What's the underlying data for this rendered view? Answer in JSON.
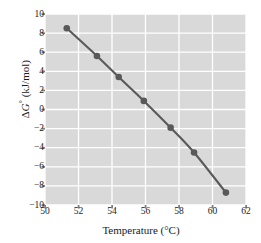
{
  "chart_data": {
    "type": "line",
    "title": "",
    "xlabel": "Temperature (°C)",
    "ylabel": "ΔG° (kJ/mol)",
    "ylabel_parts": {
      "delta": "Δ",
      "symbol": "G",
      "degree": "°",
      "units": " (kJ/mol)"
    },
    "xlim": [
      50,
      62
    ],
    "ylim": [
      -10,
      10
    ],
    "xticks": [
      50,
      52,
      54,
      56,
      58,
      60,
      62
    ],
    "xtick_labels": [
      "50",
      "52",
      "54",
      "56",
      "58",
      "60",
      "62"
    ],
    "yticks": [
      10,
      8,
      6,
      4,
      2,
      0,
      -2,
      -4,
      -6,
      -8,
      -10
    ],
    "ytick_labels": [
      "10",
      "8",
      "6",
      "4",
      "2",
      "0",
      "−2",
      "−4",
      "−6",
      "−8",
      "−10"
    ],
    "grid": true,
    "legend": false,
    "x": [
      51.3,
      53.1,
      54.4,
      55.9,
      57.5,
      58.9,
      60.8
    ],
    "y": [
      8.5,
      5.6,
      3.4,
      0.9,
      -1.9,
      -4.5,
      -8.7
    ],
    "series": [
      {
        "name": "ΔG° vs Temperature",
        "x": [
          51.3,
          53.1,
          54.4,
          55.9,
          57.5,
          58.9,
          60.8
        ],
        "values": [
          8.5,
          5.6,
          3.4,
          0.9,
          -1.9,
          -4.5,
          -8.7
        ]
      }
    ]
  },
  "style": {
    "plot_background": "#d9d9d9",
    "grid_color": "#ffffff",
    "line_color": "#595959",
    "marker_color": "#595959",
    "text_color": "#1a1a1a",
    "tick_color": "#808080",
    "page_background": "#ffffff"
  },
  "geometry": {
    "plot_left": 45,
    "plot_right": 246,
    "plot_top": 14,
    "plot_bottom": 205
  }
}
